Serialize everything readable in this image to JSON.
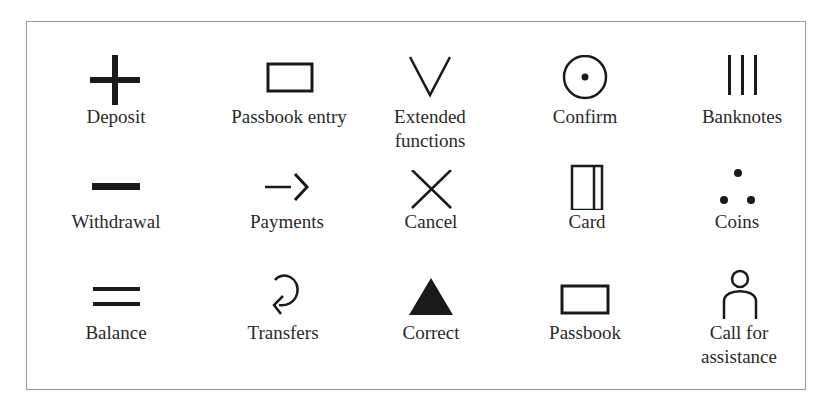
{
  "figure": {
    "symbols": [
      {
        "label": "Deposit",
        "icon": "plus-icon"
      },
      {
        "label": "Passbook entry",
        "icon": "rectangle-icon"
      },
      {
        "label": "Extended\nfunctions",
        "icon": "v-chevron-icon"
      },
      {
        "label": "Confirm",
        "icon": "circle-dot-icon"
      },
      {
        "label": "Banknotes",
        "icon": "three-bars-icon"
      },
      {
        "label": "Withdrawal",
        "icon": "minus-icon"
      },
      {
        "label": "Payments",
        "icon": "arrow-right-icon"
      },
      {
        "label": "Cancel",
        "icon": "x-icon"
      },
      {
        "label": "Card",
        "icon": "card-icon"
      },
      {
        "label": "Coins",
        "icon": "three-dots-icon"
      },
      {
        "label": "Balance",
        "icon": "equals-icon"
      },
      {
        "label": "Transfers",
        "icon": "loop-arrow-icon"
      },
      {
        "label": "Correct",
        "icon": "triangle-icon"
      },
      {
        "label": "Passbook",
        "icon": "rectangle-icon"
      },
      {
        "label": "Call for\nassistance",
        "icon": "person-icon"
      }
    ]
  }
}
